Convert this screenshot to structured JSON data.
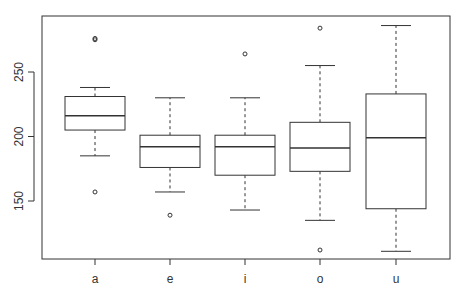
{
  "chart_data": {
    "type": "boxplot",
    "title": "",
    "xlabel": "",
    "ylabel": "",
    "categories": [
      "a",
      "e",
      "i",
      "o",
      "u"
    ],
    "boxes": [
      {
        "name": "a",
        "whisker_low": 185,
        "q1": 205,
        "median": 216,
        "q3": 231,
        "whisker_high": 238,
        "outliers": [
          157,
          275,
          276
        ]
      },
      {
        "name": "e",
        "whisker_low": 157,
        "q1": 176,
        "median": 192,
        "q3": 201,
        "whisker_high": 230,
        "outliers": [
          139
        ]
      },
      {
        "name": "i",
        "whisker_low": 143,
        "q1": 170,
        "median": 192,
        "q3": 201,
        "whisker_high": 230,
        "outliers": [
          264
        ]
      },
      {
        "name": "o",
        "whisker_low": 135,
        "q1": 173,
        "median": 191,
        "q3": 211,
        "whisker_high": 255,
        "outliers": [
          112,
          284
        ]
      },
      {
        "name": "u",
        "whisker_low": 111,
        "q1": 144,
        "median": 199,
        "q3": 233,
        "whisker_high": 286,
        "outliers": []
      }
    ],
    "y_ticks": [
      150,
      200,
      250
    ],
    "ylim": [
      106,
      290
    ],
    "grid": false,
    "legend": null
  },
  "style": {
    "line_color": "#333333",
    "background": "#ffffff"
  }
}
